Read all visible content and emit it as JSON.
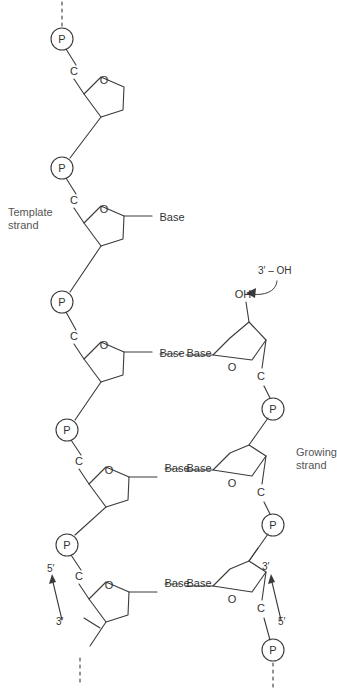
{
  "figure": {
    "kind": "dna-replication-schematic",
    "width": 337,
    "height": 697,
    "background": "#ffffff",
    "stroke_color": "#3a3a3a",
    "text_color": "#333333",
    "label_color": "#555555"
  },
  "annotations": {
    "template_strand": "Template\nstrand",
    "growing_strand": "Growing\nstrand",
    "three_prime_oh_callout": "3′ – OH"
  },
  "glyphs": {
    "phosphate": "P",
    "carbon": "C",
    "ring_oxygen": "O",
    "hydroxyl": "OH",
    "base": "Base",
    "three_prime": "3′",
    "five_prime": "5′"
  },
  "template_strand": {
    "side": "left",
    "direction_label_top": "5′",
    "direction_label_bottom": "3′",
    "phosphates": [
      {
        "id": "p-l1",
        "label": "P",
        "cx": 62,
        "cy": 39
      },
      {
        "id": "p-l2",
        "label": "P",
        "cx": 62,
        "cy": 168
      },
      {
        "id": "p-l3",
        "label": "P",
        "cx": 62,
        "cy": 302
      },
      {
        "id": "p-l4",
        "label": "P",
        "cx": 67,
        "cy": 430
      },
      {
        "id": "p-l5",
        "label": "P",
        "cx": 67,
        "cy": 545
      }
    ],
    "carbons": [
      {
        "id": "c-l1",
        "label": "C",
        "x": 74,
        "y": 72
      },
      {
        "id": "c-l2",
        "label": "C",
        "x": 74,
        "y": 201
      },
      {
        "id": "c-l3",
        "label": "C",
        "x": 74,
        "y": 337
      },
      {
        "id": "c-l4",
        "label": "C",
        "x": 79,
        "y": 462
      },
      {
        "id": "c-l5",
        "label": "C",
        "x": 79,
        "y": 577
      }
    ],
    "sugars": [
      {
        "id": "s-l1",
        "ring_oxygen": "O",
        "ox": 104,
        "oy": 81,
        "has_base": false
      },
      {
        "id": "s-l2",
        "ring_oxygen": "O",
        "ox": 104,
        "oy": 210,
        "has_base": true
      },
      {
        "id": "s-l3",
        "ring_oxygen": "O",
        "ox": 104,
        "oy": 346,
        "has_base": true
      },
      {
        "id": "s-l4",
        "ring_oxygen": "O",
        "ox": 109,
        "oy": 471,
        "has_base": true
      },
      {
        "id": "s-l5",
        "ring_oxygen": "O",
        "ox": 109,
        "oy": 586,
        "has_base": true
      }
    ],
    "bases": [
      {
        "id": "b-l2",
        "label": "Base",
        "x": 158,
        "y": 218
      },
      {
        "id": "b-l3",
        "label": "Base",
        "x": 158,
        "y": 354
      },
      {
        "id": "b-l4",
        "label": "Base",
        "x": 163,
        "y": 469
      },
      {
        "id": "b-l5",
        "label": "Base",
        "x": 163,
        "y": 584
      }
    ],
    "continues_top": true,
    "continues_bottom": true
  },
  "growing_strand": {
    "side": "right",
    "direction_label_top": "3′",
    "direction_label_bottom": "5′",
    "terminal_hydroxyl": "OH",
    "phosphates": [
      {
        "id": "p-r1",
        "label": "P",
        "cx": 273,
        "cy": 409
      },
      {
        "id": "p-r2",
        "label": "P",
        "cx": 273,
        "cy": 525
      },
      {
        "id": "p-r3",
        "label": "P",
        "cx": 273,
        "cy": 650
      }
    ],
    "carbons": [
      {
        "id": "c-r1",
        "label": "C",
        "x": 261,
        "y": 377
      },
      {
        "id": "c-r2",
        "label": "C",
        "x": 261,
        "y": 493
      },
      {
        "id": "c-r3",
        "label": "C",
        "x": 261,
        "y": 609
      }
    ],
    "sugars": [
      {
        "id": "s-r1",
        "ring_oxygen": "O",
        "ox": 232,
        "oy": 368,
        "has_base": true
      },
      {
        "id": "s-r2",
        "ring_oxygen": "O",
        "ox": 232,
        "oy": 484,
        "has_base": true
      },
      {
        "id": "s-r3",
        "ring_oxygen": "O",
        "ox": 232,
        "oy": 600,
        "has_base": true
      }
    ],
    "bases": [
      {
        "id": "b-r1",
        "label": "Base",
        "x": 186,
        "y": 354
      },
      {
        "id": "b-r2",
        "label": "Base",
        "x": 186,
        "y": 469
      },
      {
        "id": "b-r3",
        "label": "Base",
        "x": 186,
        "y": 584
      }
    ],
    "continues_bottom": true
  },
  "base_pairs": [
    {
      "id": "bp-1",
      "left": "Base",
      "right": "Base",
      "y": 354,
      "bond": "dashed"
    },
    {
      "id": "bp-2",
      "left": "Base",
      "right": "Base",
      "y": 469,
      "bond": "dashed"
    },
    {
      "id": "bp-3",
      "left": "Base",
      "right": "Base",
      "y": 584,
      "bond": "dashed"
    }
  ]
}
